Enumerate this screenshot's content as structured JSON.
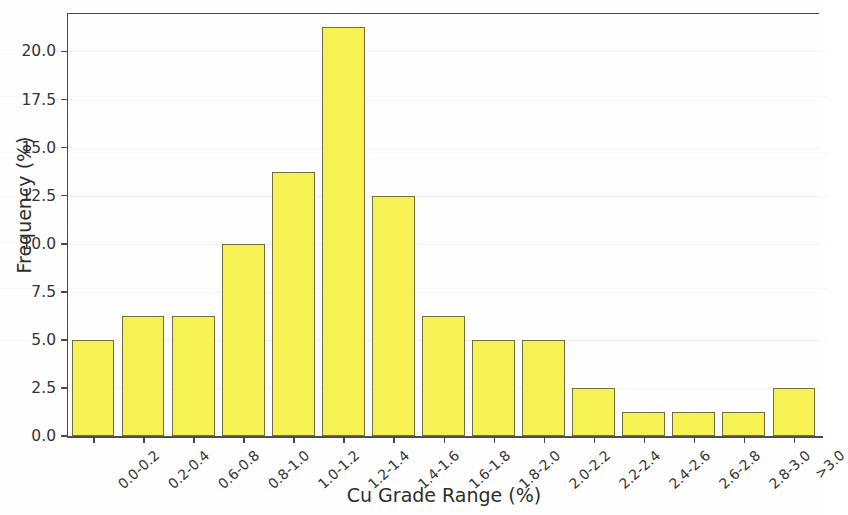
{
  "chart_data": {
    "type": "bar",
    "title": "",
    "subtitle": "",
    "xlabel": "Cu Grade Range (%)",
    "ylabel": "Frequency (%)",
    "categories": [
      "0.0-0.2",
      "0.2-0.4",
      "0.6-0.8",
      "0.8-1.0",
      "1.0-1.2",
      "1.2-1.4",
      "1.4-1.6",
      "1.6-1.8",
      "1.8-2.0",
      "2.0-2.2",
      "2.2-2.4",
      "2.4-2.6",
      "2.6-2.8",
      "2.8-3.0",
      ">3.0"
    ],
    "values": [
      5.0,
      6.25,
      6.25,
      10.0,
      13.75,
      21.25,
      12.5,
      6.25,
      5.0,
      5.0,
      2.5,
      1.25,
      1.25,
      1.25,
      2.5
    ],
    "ylim": [
      0.0,
      22.0
    ],
    "yticks": [
      0.0,
      2.5,
      5.0,
      7.5,
      10.0,
      12.5,
      15.0,
      17.5,
      20.0
    ],
    "ytick_labels": [
      "0.0",
      "2.5",
      "5.0",
      "7.5",
      "10.0",
      "12.5",
      "15.0",
      "17.5",
      "20.0"
    ],
    "grid": false,
    "legend": null,
    "bar_color": "#F6F253",
    "bar_edge_color": "#6f6f42",
    "axis_color": "#4a4a4a",
    "background_color": "#fefefe"
  }
}
